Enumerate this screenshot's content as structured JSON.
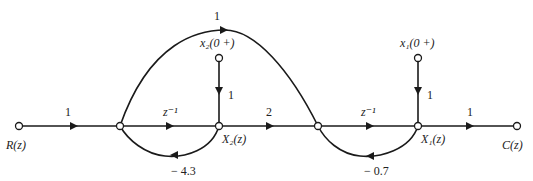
{
  "diagram": {
    "type": "signal-flow-graph",
    "nodes": {
      "input": "R(z)",
      "output": "C(z)",
      "state2": "X₂(z)",
      "state1": "X₁(z)",
      "init2": "x₂(0 +)",
      "init1": "x₁(0 +)"
    },
    "gains": {
      "input_branch": "1",
      "delay1": "z⁻¹",
      "delay2": "z⁻¹",
      "forward_x2_to_n3": "2",
      "output_branch": "1",
      "top_arc": "1",
      "init2_branch": "1",
      "init1_branch": "1",
      "feedback_x2": "− 4.3",
      "feedback_x1": "− 0.7"
    }
  }
}
